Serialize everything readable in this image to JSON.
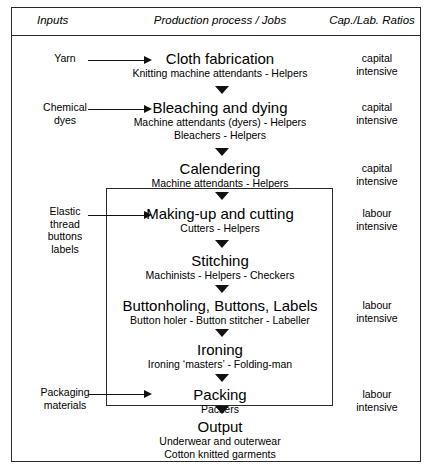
{
  "diagram": {
    "columns": {
      "inputs_header": "Inputs",
      "process_header": "Production process / Jobs",
      "ratios_header": "Cap./Lab. Ratios"
    },
    "colors": {
      "border": "#2b2b2b",
      "arrow": "#111111",
      "background": "#ffffff",
      "text": "#000000"
    },
    "stages": [
      {
        "id": "cloth-fabrication",
        "title": "Cloth fabrication",
        "jobs": [
          "Knitting machine attendants - Helpers"
        ],
        "input": [
          "Yarn"
        ],
        "ratio": [
          "capital",
          "intensive"
        ]
      },
      {
        "id": "bleaching-and-dying",
        "title": "Bleaching and dying",
        "jobs": [
          "Machine attendants (dyers) - Helpers",
          "Bleachers - Helpers"
        ],
        "input": [
          "Chemical",
          "dyes"
        ],
        "ratio": [
          "capital",
          "intensive"
        ]
      },
      {
        "id": "calendering",
        "title": "Calendering",
        "jobs": [
          "Machine attendants - Helpers"
        ],
        "input": [],
        "ratio": [
          "capital",
          "intensive"
        ]
      },
      {
        "id": "making-up-and-cutting",
        "title": "Making-up and cutting",
        "jobs": [
          "Cutters - Helpers"
        ],
        "input": [
          "Elastic",
          "thread",
          "buttons",
          "labels"
        ],
        "ratio": [
          "labour",
          "intensive"
        ]
      },
      {
        "id": "stitching",
        "title": "Stitching",
        "jobs": [
          "Machinists - Helpers - Checkers"
        ],
        "input": [],
        "ratio": []
      },
      {
        "id": "buttonholing-buttons-labels",
        "title": "Buttonholing, Buttons, Labels",
        "jobs": [
          "Button holer - Button stitcher - Labeller"
        ],
        "input": [],
        "ratio": [
          "labour",
          "intensive"
        ]
      },
      {
        "id": "ironing",
        "title": "Ironing",
        "jobs": [
          "Ironing ‘masters’ - Folding-man"
        ],
        "input": [],
        "ratio": []
      },
      {
        "id": "packing",
        "title": "Packing",
        "jobs": [
          "Packers"
        ],
        "input": [
          "Packaging",
          "materials"
        ],
        "ratio": [
          "labour",
          "intensive"
        ]
      },
      {
        "id": "output",
        "title": "Output",
        "jobs": [
          "Underwear and outerwear",
          "Cotton knitted garments"
        ],
        "input": [],
        "ratio": []
      }
    ],
    "stage_titles": {
      "s0": "Cloth fabrication",
      "s1": "Bleaching and dying",
      "s2": "Calendering",
      "s3": "Making-up and cutting",
      "s4": "Stitching",
      "s5": "Buttonholing, Buttons, Labels",
      "s6": "Ironing",
      "s7": "Packing",
      "s8": "Output"
    },
    "stage_subs": {
      "s0a": "Knitting machine attendants - Helpers",
      "s1a": "Machine attendants (dyers) - Helpers",
      "s1b": "Bleachers - Helpers",
      "s2a": "Machine attendants - Helpers",
      "s3a": "Cutters - Helpers",
      "s4a": "Machinists - Helpers - Checkers",
      "s5a": "Button holer - Button stitcher - Labeller",
      "s6a": "Ironing ‘masters’ - Folding-man",
      "s7a": "Packers",
      "s8a": "Underwear and outerwear",
      "s8b": "Cotton knitted garments"
    },
    "inputs": {
      "yarn": "Yarn",
      "chemical1": "Chemical",
      "chemical2": "dyes",
      "elastic1": "Elastic",
      "elastic2": "thread",
      "elastic3": "buttons",
      "elastic4": "labels",
      "packaging1": "Packaging",
      "packaging2": "materials"
    },
    "ratios": {
      "r0a": "capital",
      "r0b": "intensive",
      "r1a": "capital",
      "r1b": "intensive",
      "r2a": "capital",
      "r2b": "intensive",
      "r3a": "labour",
      "r3b": "intensive",
      "r5a": "labour",
      "r5b": "intensive",
      "r7a": "labour",
      "r7b": "intensive"
    }
  }
}
